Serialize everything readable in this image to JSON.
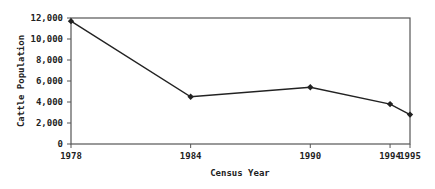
{
  "chart_data": {
    "type": "line",
    "title": "",
    "xlabel": "Census Year",
    "ylabel": "Cattle Population",
    "categories": [
      "1978",
      "1984",
      "1990",
      "1994",
      "1995"
    ],
    "series": [
      {
        "name": "Cattle Population",
        "values": [
          11700,
          4500,
          5400,
          3800,
          2800
        ]
      }
    ],
    "ylim": [
      0,
      12000
    ],
    "yticks": [
      0,
      2000,
      4000,
      6000,
      8000,
      10000,
      12000
    ],
    "ytick_labels": [
      "0",
      "2,000",
      "4,000",
      "6,000",
      "8,000",
      "10,000",
      "12,000"
    ],
    "x_values": [
      1978,
      1984,
      1990,
      1994,
      1995
    ],
    "grid": false,
    "legend": "none",
    "marker": "diamond",
    "line_color": "#222222"
  }
}
